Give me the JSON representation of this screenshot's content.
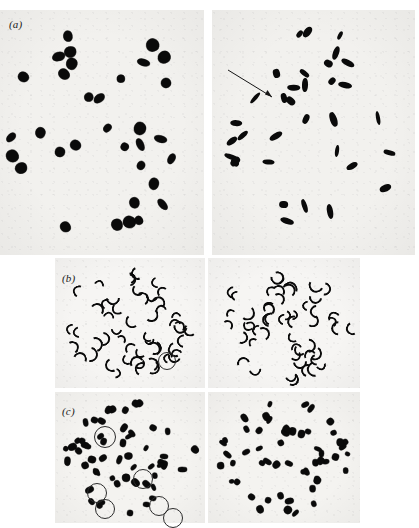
{
  "figure": {
    "type": "photomicrograph-plate",
    "background_color": "#ffffff",
    "plate_background_color": "#f2f1ee",
    "ink_color": "#0a0a0a",
    "annotation_color": "#2b2b2b",
    "panel_count": 3,
    "images_per_panel": 2
  },
  "panels": [
    {
      "id": "a",
      "label": "(a)",
      "label_x": 9,
      "label_y": 18,
      "images": [
        {
          "side": "left",
          "name": "metaphase-spread-a-left",
          "x": 0,
          "y": 10,
          "w": 204,
          "h": 245,
          "description": "C-banded metaphase spread, heavily stained blocky chromosomes",
          "chromosome_style": "blob",
          "chromosome_count": 34,
          "annotations": []
        },
        {
          "side": "right",
          "name": "metaphase-spread-a-right",
          "x": 212,
          "y": 10,
          "w": 203,
          "h": 245,
          "description": "Metaphase spread with discrete rod-shaped chromosomes",
          "chromosome_style": "rod",
          "chromosome_count": 34,
          "annotations": [
            {
              "kind": "arrow",
              "name": "arrow-marker",
              "x1": 228,
              "y1": 70,
              "x2": 272,
              "y2": 97
            }
          ]
        }
      ]
    },
    {
      "id": "b",
      "label": "(b)",
      "label_x": 62,
      "label_y": 272,
      "images": [
        {
          "side": "left",
          "name": "metaphase-spread-b-left",
          "x": 55,
          "y": 258,
          "w": 150,
          "h": 130,
          "description": "Mitotic spread, small hook and V shaped chromosomes",
          "chromosome_style": "hook",
          "chromosome_count": 52,
          "annotations": [
            {
              "kind": "circle",
              "name": "circled-chromosome",
              "cx": 166,
              "cy": 360,
              "r": 8
            }
          ]
        },
        {
          "side": "right",
          "name": "metaphase-spread-b-right",
          "x": 208,
          "y": 258,
          "w": 152,
          "h": 130,
          "description": "Mitotic spread, small hook and V shaped chromosomes",
          "chromosome_style": "hook",
          "chromosome_count": 52,
          "annotations": []
        }
      ]
    },
    {
      "id": "c",
      "label": "(c)",
      "label_x": 62,
      "label_y": 405,
      "images": [
        {
          "side": "left",
          "name": "metaphase-spread-c-left",
          "x": 55,
          "y": 392,
          "w": 150,
          "h": 131,
          "description": "C-banded spread with six circled marker chromosomes",
          "chromosome_style": "blob",
          "chromosome_count": 54,
          "annotations": [
            {
              "kind": "circle",
              "name": "circled-chromosome",
              "cx": 104,
              "cy": 436,
              "r": 10
            },
            {
              "kind": "circle",
              "name": "circled-chromosome",
              "cx": 142,
              "cy": 478,
              "r": 9
            },
            {
              "kind": "circle",
              "name": "circled-chromosome",
              "cx": 96,
              "cy": 492,
              "r": 9
            },
            {
              "kind": "circle",
              "name": "circled-chromosome",
              "cx": 104,
              "cy": 508,
              "r": 9
            },
            {
              "kind": "circle",
              "name": "circled-chromosome",
              "cx": 158,
              "cy": 505,
              "r": 9
            },
            {
              "kind": "circle",
              "name": "circled-chromosome",
              "cx": 172,
              "cy": 517,
              "r": 9
            }
          ]
        },
        {
          "side": "right",
          "name": "metaphase-spread-c-right",
          "x": 208,
          "y": 392,
          "w": 152,
          "h": 131,
          "description": "Matching spread without circled markers",
          "chromosome_style": "blob",
          "chromosome_count": 54,
          "annotations": []
        }
      ]
    }
  ],
  "chart_data": {
    "type": "image-plate",
    "title": "",
    "panels": [
      "(a)",
      "(b)",
      "(c)"
    ]
  }
}
